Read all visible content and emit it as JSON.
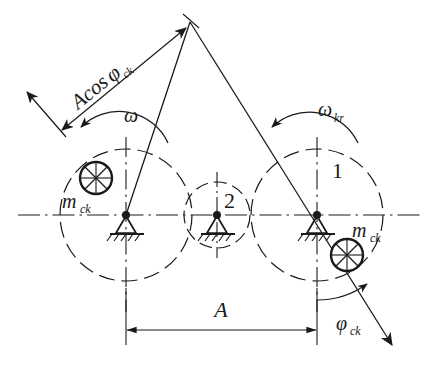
{
  "figure": {
    "type": "mechanical-schematic",
    "background_color": "#ffffff",
    "line_color": "#1a1a1a"
  },
  "labels": {
    "projection_dimension": {
      "base": "Acos",
      "phi": "φ",
      "sub": "ck",
      "full": "Acosφck"
    },
    "omega_left": "ω",
    "omega_right": {
      "base": "ω",
      "sub": "kr",
      "full": "ωkr"
    },
    "rotor_one": "1",
    "rotor_two": "2",
    "mass_left": {
      "base": "m",
      "sub": "ck",
      "full": "mck"
    },
    "mass_right": {
      "base": "m",
      "sub": "ck",
      "full": "mck"
    },
    "span_dimension": "A",
    "angle_phi": {
      "base": "φ",
      "sub": "ck",
      "full": "φck"
    }
  },
  "geometry": {
    "axis_y": 215,
    "rotors": [
      {
        "name": "left-rotor",
        "cx": 126,
        "cy": 215,
        "r": 66
      },
      {
        "name": "center-support-rotor",
        "cx": 217,
        "cy": 215,
        "r": 33
      },
      {
        "name": "right-rotor",
        "cx": 317,
        "cy": 215,
        "r": 66
      }
    ],
    "masses": [
      {
        "name": "left-mass",
        "cx": 96,
        "cy": 178,
        "r": 16
      },
      {
        "name": "right-mass",
        "cx": 347,
        "cy": 255,
        "r": 16
      }
    ],
    "span": {
      "x1": 126,
      "x2": 317,
      "y": 330
    }
  }
}
